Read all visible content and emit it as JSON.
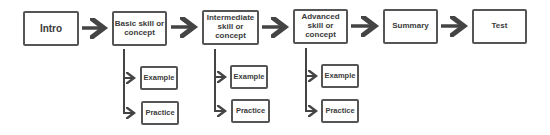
{
  "flow": {
    "steps": [
      {
        "label": "Intro"
      },
      {
        "label": "Basic skill or concept"
      },
      {
        "label": "Intermediate skill or concept"
      },
      {
        "label": "Advanced skill or concept"
      },
      {
        "label": "Summary"
      },
      {
        "label": "Test"
      }
    ],
    "branches": [
      {
        "parent": "Basic skill or concept",
        "children": [
          {
            "label": "Example"
          },
          {
            "label": "Practice"
          }
        ]
      },
      {
        "parent": "Intermediate skill or concept",
        "children": [
          {
            "label": "Example"
          },
          {
            "label": "Practice"
          }
        ]
      },
      {
        "parent": "Advanced skill or concept",
        "children": [
          {
            "label": "Example"
          },
          {
            "label": "Practice"
          }
        ]
      }
    ]
  },
  "colors": {
    "stroke": "#555555",
    "text": "#3a3a3a",
    "background": "#ffffff"
  }
}
